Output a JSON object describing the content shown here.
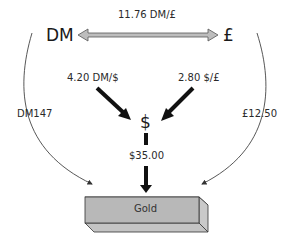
{
  "nodes": {
    "dm": "DM",
    "pound": "£",
    "dollar": "$",
    "gold": "Gold"
  },
  "rates": {
    "dm_per_pound": "11.76 DM/£",
    "dm_per_dollar": "4.20 DM/$",
    "dollar_per_pound": "2.80 $/£"
  },
  "prices": {
    "gold_in_dm": "DM147",
    "gold_in_pound": "£12.50",
    "gold_in_dollar": "$35.00"
  },
  "colors": {
    "double_arrow_fill": "#bdbdbd",
    "gold_front": "#b8b8b8",
    "gold_side": "#d0d0d0",
    "arrow_dark": "#111111",
    "curve": "#444444"
  }
}
